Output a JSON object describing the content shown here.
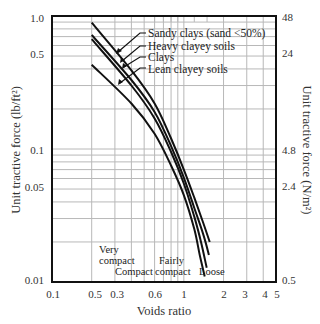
{
  "chart_data": {
    "type": "line",
    "title": "",
    "xlabel": "Voids ratio",
    "ylabel": "Unit tractive force (lb/ft²)",
    "ylabel_right": "Unit tractive force (N/m²)",
    "xscale": "log",
    "yscale": "log",
    "xlim": [
      0.1,
      5
    ],
    "ylim": [
      0.01,
      1.0
    ],
    "grid": true,
    "x_tick_labels": [
      "0.1",
      "0.5",
      "0.3",
      "0.6",
      "1",
      "2",
      "3",
      "4",
      "5"
    ],
    "x_tick_values": [
      0.1,
      0.2,
      0.3,
      0.6,
      1,
      2,
      3,
      4,
      5
    ],
    "y_tick_labels_left": [
      "1.0",
      "0.5",
      "0.1",
      "0.05",
      "0.01"
    ],
    "y_tick_values_left": [
      1.0,
      0.5,
      0.1,
      0.05,
      0.01
    ],
    "y_tick_labels_right": [
      "48",
      "24",
      "4.8",
      "2.4",
      "0.5"
    ],
    "y_tick_values_right": [
      48,
      24,
      4.8,
      2.4,
      0.5
    ],
    "series": [
      {
        "name": "Sandy clays (sand <50%)",
        "x": [
          0.2,
          0.4,
          0.6,
          0.8,
          1.0,
          1.2,
          1.4,
          1.57
        ],
        "y": [
          0.89,
          0.39,
          0.22,
          0.12,
          0.07,
          0.043,
          0.028,
          0.02
        ]
      },
      {
        "name": "Heavy clayey soils",
        "x": [
          0.2,
          0.4,
          0.6,
          0.8,
          1.0,
          1.2,
          1.4,
          1.55
        ],
        "y": [
          0.72,
          0.33,
          0.19,
          0.105,
          0.061,
          0.036,
          0.023,
          0.016
        ]
      },
      {
        "name": "Clays",
        "x": [
          0.2,
          0.4,
          0.6,
          0.8,
          1.0,
          1.2,
          1.35,
          1.49
        ],
        "y": [
          0.67,
          0.3,
          0.17,
          0.095,
          0.055,
          0.031,
          0.02,
          0.0128
        ]
      },
      {
        "name": "Lean clayey soils",
        "x": [
          0.2,
          0.4,
          0.6,
          0.8,
          1.0,
          1.2,
          1.32,
          1.44
        ],
        "y": [
          0.43,
          0.22,
          0.13,
          0.075,
          0.045,
          0.025,
          0.016,
          0.011
        ]
      }
    ],
    "annotations": [
      {
        "text": "Very compact",
        "x_range": [
          0.2,
          0.3
        ]
      },
      {
        "text": "Compact",
        "x_range": [
          0.3,
          0.6
        ]
      },
      {
        "text": "Fairly compact",
        "x_range": [
          0.6,
          1.0
        ]
      },
      {
        "text": "Loose",
        "x_range": [
          1.0,
          2.0
        ]
      }
    ],
    "legend_position": "inline labels with leader arrows, upper right"
  },
  "labels": {
    "x_title": "Voids ratio",
    "y_title_left": "Unit tractive force (lb/ft²)",
    "y_title_right": "Unit tractive force (N/m²)",
    "series": [
      "Sandy clays (sand <50%)",
      "Heavy clayey soils",
      "Clays",
      "Lean clayey soils"
    ],
    "zones": {
      "very": "Very",
      "compact1": "compact",
      "compact": "Compact",
      "fairly": "Fairly",
      "compact2": "compact",
      "loose": "Loose"
    },
    "xticks": [
      "0.1",
      "0.5",
      "0.3",
      "0.6",
      "1",
      "2",
      "3",
      "4",
      "5"
    ],
    "yticks_left": [
      "1.0",
      "0.5",
      "0.1",
      "0.05",
      "0.01"
    ],
    "yticks_right": [
      "48",
      "24",
      "4.8",
      "2.4",
      "0.5"
    ]
  }
}
